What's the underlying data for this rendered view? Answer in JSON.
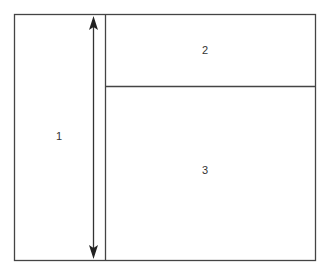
{
  "diagram": {
    "type": "layout-regions",
    "regions": [
      {
        "id": "region-1",
        "label": "1"
      },
      {
        "id": "region-2",
        "label": "2"
      },
      {
        "id": "region-3",
        "label": "3"
      }
    ],
    "colors": {
      "stroke": "#333333",
      "background": "#ffffff"
    }
  }
}
